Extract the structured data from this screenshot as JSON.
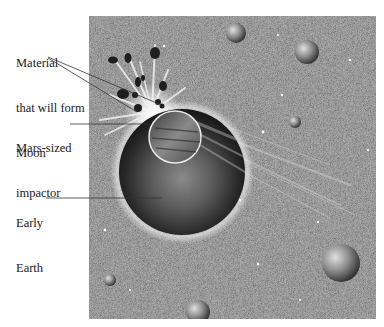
{
  "figure": {
    "labels": [
      {
        "id": "material",
        "lines": [
          "Material",
          "that will form",
          "Moon"
        ]
      },
      {
        "id": "impactor",
        "lines": [
          "Mars-sized",
          "impactor"
        ]
      },
      {
        "id": "earth",
        "lines": [
          "Early",
          "Earth"
        ]
      }
    ]
  },
  "colors": {
    "background": "#ffffff",
    "space": "#6e6e6e",
    "label_text": "#222222",
    "leader_line": "#333333"
  }
}
